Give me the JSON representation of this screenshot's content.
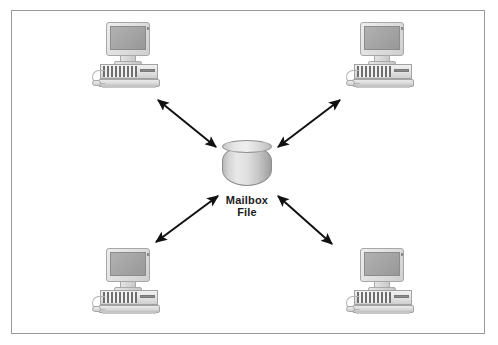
{
  "diagram": {
    "type": "hub-and-spoke",
    "background_color": "#ffffff",
    "frame": {
      "border_color": "#9a9a9a",
      "x": 11,
      "y": 10,
      "width": 474,
      "height": 324
    },
    "hub": {
      "name": "mailbox-file-cylinder",
      "shape": "cylinder",
      "label_line1": "Mailbox",
      "label_line2": "File",
      "label_color": "#1c1c1c",
      "fill_color": "#dcdcdc",
      "stroke_color": "#8e8e8e",
      "x": 222,
      "y": 140,
      "width": 50,
      "height": 46
    },
    "nodes": [
      {
        "id": "workstation-top-left",
        "label": "",
        "x": 92,
        "y": 22
      },
      {
        "id": "workstation-top-right",
        "label": "",
        "x": 346,
        "y": 22
      },
      {
        "id": "workstation-bottom-left",
        "label": "",
        "x": 92,
        "y": 248
      },
      {
        "id": "workstation-bottom-right",
        "label": "",
        "x": 346,
        "y": 248
      }
    ],
    "connections": [
      {
        "id": "link-top-left",
        "from": "mailbox-file-cylinder",
        "to": "workstation-top-left",
        "direction": "bidirectional",
        "x1": 216,
        "y1": 147,
        "x2": 158,
        "y2": 100,
        "color": "#111111"
      },
      {
        "id": "link-top-right",
        "from": "mailbox-file-cylinder",
        "to": "workstation-top-right",
        "direction": "bidirectional",
        "x1": 278,
        "y1": 147,
        "x2": 340,
        "y2": 100,
        "color": "#111111"
      },
      {
        "id": "link-bottom-left",
        "from": "mailbox-file-cylinder",
        "to": "workstation-bottom-left",
        "direction": "bidirectional",
        "x1": 218,
        "y1": 196,
        "x2": 156,
        "y2": 242,
        "color": "#111111"
      },
      {
        "id": "link-bottom-right",
        "from": "mailbox-file-cylinder",
        "to": "workstation-bottom-right",
        "direction": "bidirectional",
        "x1": 278,
        "y1": 196,
        "x2": 332,
        "y2": 244,
        "color": "#111111"
      }
    ],
    "workstation_parts": {
      "monitor": "monitor",
      "screen": "screen",
      "system_unit": "system-unit",
      "vents": "vent-slats",
      "drive_slot": "floppy-drive-slot",
      "keyboard": "keyboard",
      "mouse": "mouse"
    }
  }
}
